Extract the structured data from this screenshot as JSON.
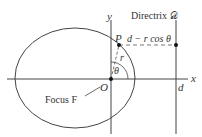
{
  "diagram": {
    "axis_labels": {
      "x": "x",
      "y": "y"
    },
    "origin_label": "O",
    "point_label": "P",
    "radius_label": "r",
    "angle_label": "θ",
    "directrix_label": "Directrix 𝒟",
    "distance_label": "d − r cos θ",
    "d_label": "d",
    "focus_label": "Focus F",
    "colors": {
      "stroke": "#444444",
      "background": "#ffffff"
    }
  }
}
